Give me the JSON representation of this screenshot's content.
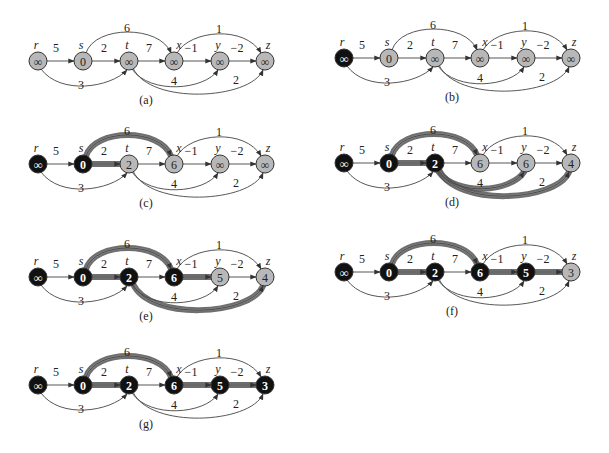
{
  "figure": {
    "colors": {
      "gray_node": "#b8b8b8",
      "black_node": "#111111",
      "edge": "#444444",
      "shaded_edge": "#555555",
      "background": "#ffffff"
    },
    "node_names": [
      "r",
      "s",
      "t",
      "x",
      "y",
      "z"
    ],
    "edges": [
      {
        "from": "r",
        "to": "s",
        "w": "5"
      },
      {
        "from": "r",
        "to": "t",
        "w": "3"
      },
      {
        "from": "s",
        "to": "t",
        "w": "2"
      },
      {
        "from": "s",
        "to": "x",
        "w": "6"
      },
      {
        "from": "t",
        "to": "x",
        "w": "7"
      },
      {
        "from": "t",
        "to": "y",
        "w": "4"
      },
      {
        "from": "t",
        "to": "z",
        "w": "2"
      },
      {
        "from": "x",
        "to": "y",
        "w": "−1"
      },
      {
        "from": "x",
        "to": "z",
        "w": "1"
      },
      {
        "from": "y",
        "to": "z",
        "w": "−2"
      }
    ],
    "panels": [
      {
        "caption": "(a)",
        "ox": 0,
        "oy": 0,
        "values": {
          "r": "∞",
          "s": "0",
          "t": "∞",
          "x": "∞",
          "y": "∞",
          "z": "∞"
        },
        "black": [],
        "shaded": []
      },
      {
        "caption": "(b)",
        "ox": 306,
        "oy": -3,
        "values": {
          "r": "∞",
          "s": "0",
          "t": "∞",
          "x": "∞",
          "y": "∞",
          "z": "∞"
        },
        "black": [
          "r"
        ],
        "shaded": []
      },
      {
        "caption": "(c)",
        "ox": 0,
        "oy": 103,
        "values": {
          "r": "∞",
          "s": "0",
          "t": "2",
          "x": "6",
          "y": "∞",
          "z": "∞"
        },
        "black": [
          "r",
          "s"
        ],
        "shaded": [
          "s-t",
          "s-x"
        ]
      },
      {
        "caption": "(d)",
        "ox": 306,
        "oy": 102,
        "values": {
          "r": "∞",
          "s": "0",
          "t": "2",
          "x": "6",
          "y": "6",
          "z": "4"
        },
        "black": [
          "r",
          "s",
          "t"
        ],
        "shaded": [
          "s-t",
          "s-x",
          "t-y",
          "t-z"
        ]
      },
      {
        "caption": "(e)",
        "ox": 0,
        "oy": 216,
        "values": {
          "r": "∞",
          "s": "0",
          "t": "2",
          "x": "6",
          "y": "5",
          "z": "4"
        },
        "black": [
          "r",
          "s",
          "t",
          "x"
        ],
        "shaded": [
          "s-t",
          "s-x",
          "x-y",
          "t-z"
        ]
      },
      {
        "caption": "(f)",
        "ox": 306,
        "oy": 211,
        "values": {
          "r": "∞",
          "s": "0",
          "t": "2",
          "x": "6",
          "y": "5",
          "z": "3"
        },
        "black": [
          "r",
          "s",
          "t",
          "x",
          "y"
        ],
        "shaded": [
          "s-t",
          "s-x",
          "x-y",
          "y-z"
        ]
      },
      {
        "caption": "(g)",
        "ox": 0,
        "oy": 324,
        "values": {
          "r": "∞",
          "s": "0",
          "t": "2",
          "x": "6",
          "y": "5",
          "z": "3"
        },
        "black": [
          "r",
          "s",
          "t",
          "x",
          "y",
          "z"
        ],
        "shaded": [
          "s-t",
          "s-x",
          "x-y",
          "y-z"
        ]
      }
    ]
  }
}
